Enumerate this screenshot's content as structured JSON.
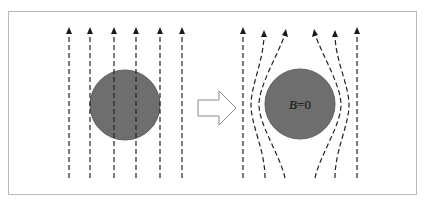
{
  "figure": {
    "colors": {
      "background": "#ffffff",
      "frame": "#b9b9b9",
      "sphere_fill": "#6e6e6e",
      "sphere_stroke": "#5e5e5e",
      "field_line": "#222222",
      "arrow_outline": "#8a8a8a"
    },
    "left_panel": {
      "sphere": {
        "cx": 125,
        "cy": 105,
        "r": 35
      },
      "field_lines_x": [
        69,
        90,
        114,
        136,
        160,
        182
      ],
      "line_top_y": 28,
      "line_bottom_y": 178
    },
    "transition_arrow": {
      "direction": "right",
      "style": "hollow-block-arrow"
    },
    "right_panel": {
      "sphere": {
        "cx": 300,
        "cy": 104,
        "r": 35
      },
      "label": "B=0",
      "label_var": "B",
      "label_rest": "=0"
    }
  }
}
